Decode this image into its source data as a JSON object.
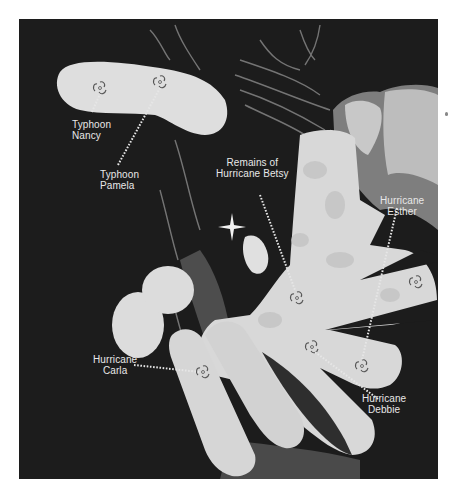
{
  "figure": {
    "colors": {
      "background_page": "#ffffff",
      "photo_background": "#1c1c1c",
      "cloud_fill": "#dcdcdc",
      "label_text": "#e8e8e8"
    }
  },
  "labels": {
    "typhoon_nancy": {
      "line1": "Typhoon",
      "line2": "Nancy"
    },
    "typhoon_pamela": {
      "line1": "Typhoon",
      "line2": "Pamela"
    },
    "hurricane_betsy": {
      "line1": "Remains of",
      "line2": "Hurricane Betsy"
    },
    "hurricane_esther": {
      "line1": "Hurricane",
      "line2": "Esther"
    },
    "hurricane_carla": {
      "line1": "Hurricane",
      "line2": "Carla"
    },
    "hurricane_debbie": {
      "line1": "Hurricane",
      "line2": "Debbie"
    }
  },
  "storm_symbols": [
    {
      "name": "Typhoon Nancy",
      "icon": "cyclone-symbol"
    },
    {
      "name": "Typhoon Pamela",
      "icon": "cyclone-symbol"
    },
    {
      "name": "Hurricane Betsy",
      "icon": "cyclone-symbol"
    },
    {
      "name": "Hurricane Esther",
      "icon": "cyclone-symbol"
    },
    {
      "name": "Hurricane Carla",
      "icon": "cyclone-symbol"
    },
    {
      "name": "Hurricane Debbie",
      "icon": "cyclone-symbol"
    },
    {
      "name": "Unlabeled (east)",
      "icon": "cyclone-symbol"
    }
  ]
}
